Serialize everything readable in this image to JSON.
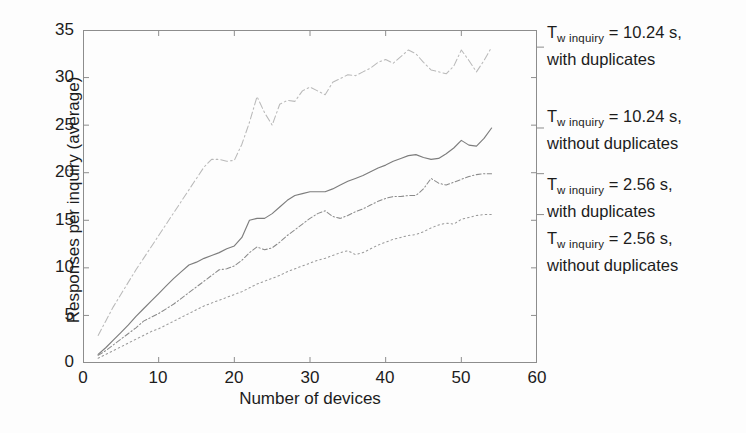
{
  "figure": {
    "background": "#fdfdfd",
    "axis_color": "#8d8d8d"
  },
  "axes": {
    "xlabel": "Number of devices",
    "ylabel": "Responses per inquiry (average)",
    "xticks": [
      "0",
      "10",
      "20",
      "30",
      "40",
      "50",
      "60"
    ],
    "yticks": [
      "0",
      "5",
      "10",
      "15",
      "20",
      "25",
      "30",
      "35"
    ]
  },
  "legend": {
    "entries": [
      {
        "symbol": "T",
        "sub": "w inquiry",
        "line1_tail": " = 10.24 s,",
        "line2": "with duplicates",
        "series_key": "t1024_with_dup"
      },
      {
        "symbol": "T",
        "sub": "w inquiry",
        "line1_tail": " = 10.24 s,",
        "line2": "without duplicates",
        "series_key": "t1024_without_dup"
      },
      {
        "symbol": "T",
        "sub": "w inquiry",
        "line1_tail": " = 2.56 s,",
        "line2": "with duplicates",
        "series_key": "t256_with_dup"
      },
      {
        "symbol": "T",
        "sub": "w inquiry",
        "line1_tail": " = 2.56 s,",
        "line2": "without duplicates",
        "series_key": "t256_without_dup"
      }
    ]
  },
  "chart_data": {
    "type": "line",
    "title": "",
    "xlabel": "Number of devices",
    "ylabel": "Responses per inquiry (average)",
    "xlim": [
      0,
      60
    ],
    "ylim": [
      0,
      35
    ],
    "xticks": [
      0,
      10,
      20,
      30,
      40,
      50,
      60
    ],
    "yticks": [
      0,
      5,
      10,
      15,
      20,
      25,
      30,
      35
    ],
    "grid": false,
    "legend_position": "right-outside",
    "x": [
      2,
      3,
      4,
      5,
      6,
      7,
      8,
      9,
      10,
      11,
      12,
      13,
      14,
      15,
      16,
      17,
      18,
      19,
      20,
      21,
      22,
      23,
      24,
      25,
      26,
      27,
      28,
      29,
      30,
      31,
      32,
      33,
      34,
      35,
      36,
      37,
      38,
      39,
      40,
      41,
      42,
      43,
      44,
      45,
      46,
      47,
      48,
      49,
      50,
      51,
      52,
      53,
      54
    ],
    "series": [
      {
        "name": "T_w inquiry = 10.24 s, with duplicates",
        "key": "t1024_with_dup",
        "style": "dash-dot",
        "color": "#b9b9b9",
        "values": [
          2.9,
          4.4,
          5.9,
          7.2,
          8.5,
          9.8,
          11.0,
          12.2,
          13.4,
          14.6,
          15.8,
          17.0,
          18.2,
          19.4,
          20.6,
          21.4,
          21.4,
          21.2,
          21.3,
          23.0,
          25.3,
          28.0,
          26.3,
          25.0,
          27.2,
          27.6,
          27.5,
          28.6,
          29.0,
          28.6,
          28.2,
          29.5,
          29.9,
          30.3,
          30.2,
          30.6,
          31.0,
          31.6,
          31.9,
          31.5,
          32.2,
          32.9,
          32.5,
          31.6,
          30.8,
          30.6,
          30.4,
          31.2,
          32.9,
          31.8,
          30.6,
          31.8,
          33.2
        ]
      },
      {
        "name": "T_w inquiry = 10.24 s, without duplicates",
        "key": "t1024_without_dup",
        "style": "solid",
        "color": "#7d7d7d",
        "values": [
          0.9,
          1.6,
          2.4,
          3.2,
          4.0,
          4.9,
          5.7,
          6.5,
          7.3,
          8.1,
          8.9,
          9.6,
          10.3,
          10.6,
          11.0,
          11.3,
          11.6,
          12.0,
          12.3,
          13.2,
          15.0,
          15.2,
          15.2,
          15.7,
          16.4,
          17.1,
          17.6,
          17.8,
          18.0,
          18.0,
          18.0,
          18.3,
          18.7,
          19.1,
          19.4,
          19.7,
          20.1,
          20.5,
          20.8,
          21.2,
          21.5,
          21.8,
          21.9,
          21.6,
          21.4,
          21.5,
          22.0,
          22.6,
          23.4,
          22.9,
          22.8,
          23.6,
          24.7
        ]
      },
      {
        "name": "T_w inquiry = 2.56 s, with duplicates",
        "key": "t256_with_dup",
        "style": "dash-dot-fine",
        "color": "#8a8a8a",
        "values": [
          0.8,
          1.3,
          1.9,
          2.5,
          3.1,
          3.7,
          4.4,
          4.8,
          5.2,
          5.7,
          6.2,
          6.8,
          7.4,
          8.0,
          8.6,
          9.2,
          9.8,
          9.9,
          10.2,
          10.8,
          11.6,
          12.2,
          11.9,
          12.1,
          12.7,
          13.4,
          14.0,
          14.6,
          15.2,
          15.7,
          16.0,
          15.4,
          15.2,
          15.5,
          15.9,
          16.2,
          16.6,
          17.0,
          17.3,
          17.5,
          17.5,
          17.6,
          17.6,
          18.3,
          19.4,
          18.9,
          18.7,
          19.0,
          19.3,
          19.6,
          19.8,
          19.9,
          19.9
        ]
      },
      {
        "name": "T_w inquiry = 2.56 s, without duplicates",
        "key": "t256_without_dup",
        "style": "dotted",
        "color": "#9a9a9a",
        "values": [
          0.5,
          0.9,
          1.3,
          1.7,
          2.1,
          2.5,
          2.9,
          3.3,
          3.6,
          4.0,
          4.4,
          4.8,
          5.2,
          5.6,
          6.0,
          6.3,
          6.6,
          6.9,
          7.2,
          7.5,
          7.9,
          8.3,
          8.6,
          8.9,
          9.2,
          9.6,
          9.9,
          10.2,
          10.5,
          10.8,
          11.0,
          11.3,
          11.6,
          11.8,
          11.4,
          11.6,
          12.0,
          12.4,
          12.7,
          13.0,
          13.2,
          13.4,
          13.5,
          13.8,
          14.2,
          14.5,
          14.7,
          14.6,
          15.1,
          15.3,
          15.5,
          15.6,
          15.6
        ]
      }
    ]
  }
}
